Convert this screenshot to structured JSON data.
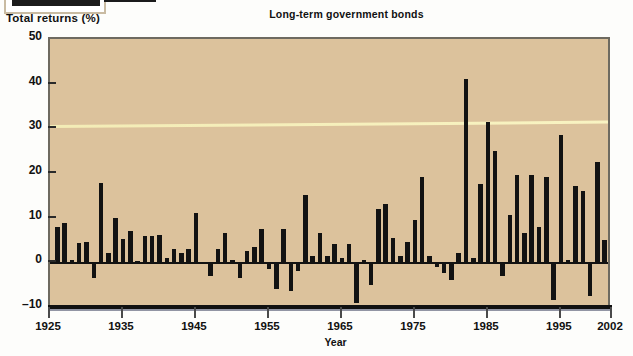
{
  "figure": {
    "title": "Long-term government bonds",
    "y_axis_title": "Total returns (%)",
    "x_axis_title": "Year"
  },
  "colors": {
    "plot_background": "#dcc29c",
    "bar": "#121212",
    "axis": "#111111",
    "page_background": "#ffffff",
    "frame": "#6e6a60",
    "streak": "#f7f3ba"
  },
  "chart_data": {
    "type": "bar",
    "title": "Long-term government bonds",
    "xlabel": "Year",
    "ylabel": "Total returns (%)",
    "xlim": [
      1925,
      2002
    ],
    "ylim": [
      -10,
      50
    ],
    "ytick_values": [
      -10,
      0,
      10,
      20,
      30,
      40,
      50
    ],
    "ytick_labels": [
      "-10",
      "0",
      "10",
      "20",
      "30",
      "40",
      "50"
    ],
    "xtick_values": [
      1925,
      1935,
      1945,
      1955,
      1965,
      1975,
      1985,
      1995,
      2002
    ],
    "xtick_labels": [
      "1925",
      "1935",
      "1945",
      "1955",
      "1965",
      "1975",
      "1985",
      "1995",
      "2002"
    ],
    "grid": false,
    "legend": null,
    "series_name": "Total returns (%)",
    "categories": [
      1926,
      1927,
      1928,
      1929,
      1930,
      1931,
      1932,
      1933,
      1934,
      1935,
      1936,
      1937,
      1938,
      1939,
      1940,
      1941,
      1942,
      1943,
      1944,
      1945,
      1946,
      1947,
      1948,
      1949,
      1950,
      1951,
      1952,
      1953,
      1954,
      1955,
      1956,
      1957,
      1958,
      1959,
      1960,
      1961,
      1962,
      1963,
      1964,
      1965,
      1966,
      1967,
      1968,
      1969,
      1970,
      1971,
      1972,
      1973,
      1974,
      1975,
      1976,
      1977,
      1978,
      1979,
      1980,
      1981,
      1982,
      1983,
      1984,
      1985,
      1986,
      1987,
      1988,
      1989,
      1990,
      1991,
      1992,
      1993,
      1994,
      1995,
      1996,
      1997,
      1998,
      1999,
      2000,
      2001,
      2002
    ],
    "values": [
      7.8,
      8.9,
      0.5,
      4.4,
      4.5,
      -3.5,
      17.8,
      2.0,
      10.0,
      5.3,
      7.0,
      0.3,
      6.0,
      6.0,
      6.2,
      1.0,
      3.0,
      2.0,
      3.0,
      11.0,
      -0.3,
      -3.0,
      3.0,
      6.5,
      0.5,
      -3.5,
      2.5,
      3.5,
      7.5,
      -1.5,
      -6.0,
      7.5,
      -6.5,
      -2.0,
      15.0,
      1.5,
      6.5,
      1.5,
      4.0,
      1.0,
      4.0,
      -9.0,
      0.5,
      -5.0,
      12.0,
      13.0,
      5.5,
      1.5,
      4.5,
      9.5,
      19.0,
      1.5,
      -1.0,
      -2.5,
      -4.0,
      2.0,
      41.0,
      1.0,
      17.5,
      31.5,
      25.0,
      -3.0,
      10.5,
      19.5,
      6.5,
      19.5,
      8.0,
      19.0,
      -8.5,
      28.5,
      0.5,
      17.0,
      16.0,
      -7.5,
      22.5,
      5.0,
      18.0
    ]
  }
}
